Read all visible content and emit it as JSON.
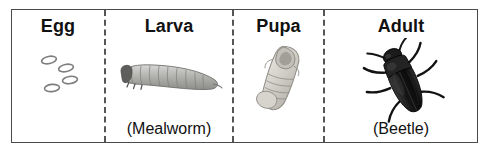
{
  "figure": {
    "name": "mealworm-life-cycle-diagram",
    "border_color": "#4a4a4a",
    "divider_color": "#555555",
    "background": "#ffffff"
  },
  "stages": [
    {
      "id": "egg",
      "title": "Egg",
      "caption": "",
      "art": "egg-cluster-illustration",
      "art_description": "four small white outlined oval eggs",
      "art_color": "#808080"
    },
    {
      "id": "larva",
      "title": "Larva",
      "caption": "(Mealworm)",
      "art": "mealworm-larva-photo",
      "art_description": "segmented light gray mealworm larva curving to the right",
      "art_color": "#a8a8a8"
    },
    {
      "id": "pupa",
      "title": "Pupa",
      "caption": "",
      "art": "mealworm-pupa-photo",
      "art_description": "pale cream colored pupa tilted diagonally",
      "art_color": "#cfcdc6"
    },
    {
      "id": "adult",
      "title": "Adult",
      "caption": "(Beetle)",
      "art": "darkling-beetle-photo",
      "art_description": "dark black darkling beetle tilted with legs and antennae",
      "art_color": "#1a1a1a"
    }
  ]
}
